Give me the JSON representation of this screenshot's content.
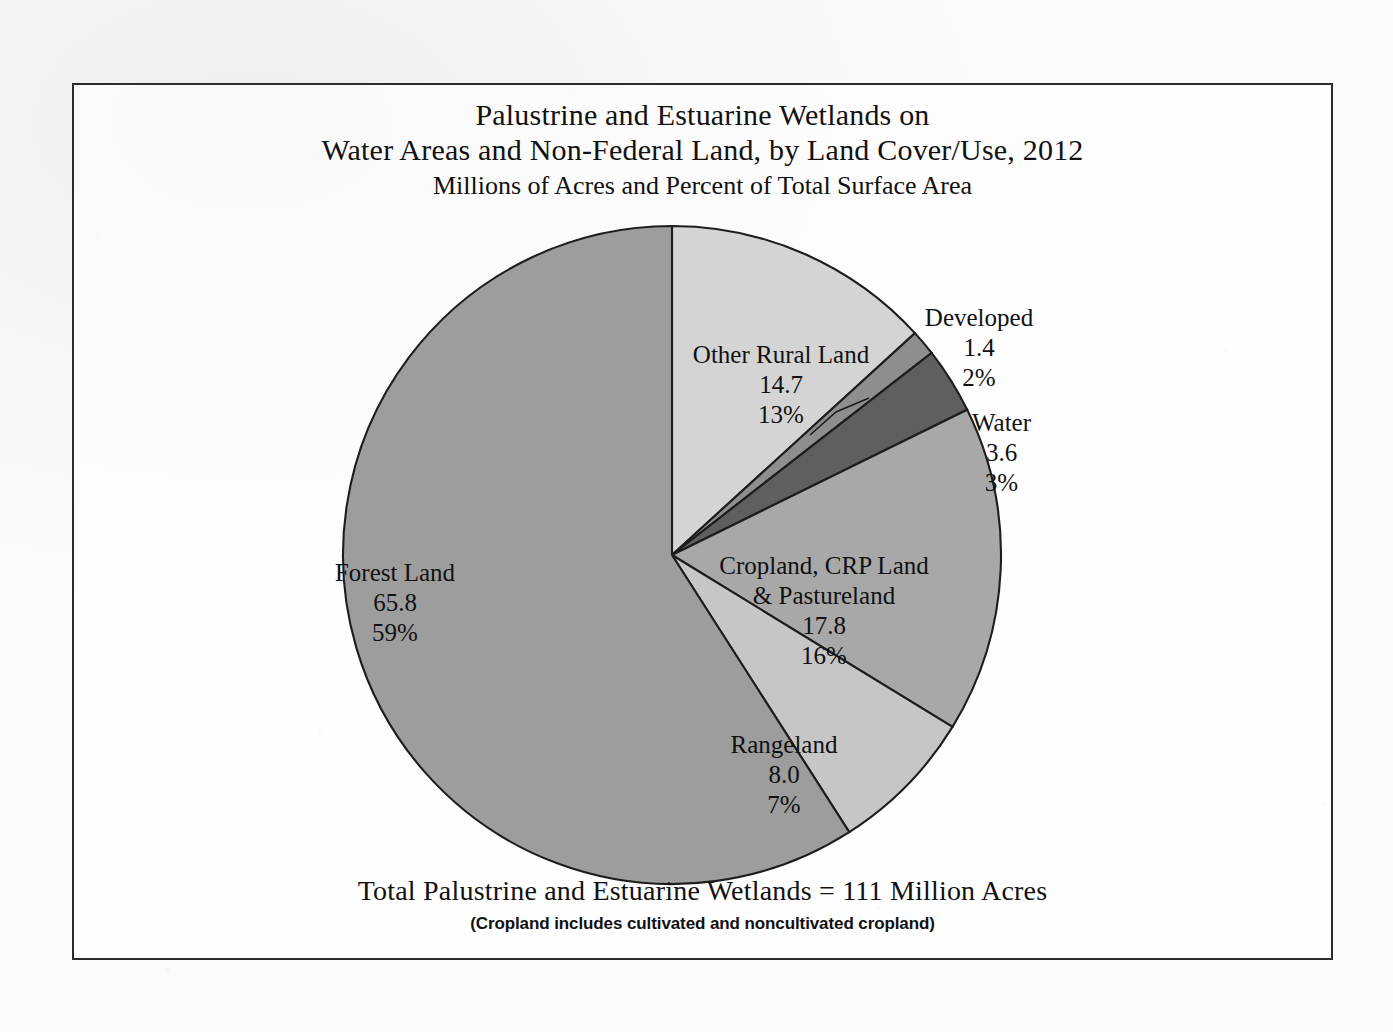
{
  "chart_data": {
    "type": "pie",
    "title": "Palustrine and Estuarine Wetlands on Water Areas and Non-Federal Land, by Land Cover/Use, 2012",
    "title_lines": [
      "Palustrine and Estuarine Wetlands on",
      "Water Areas and Non-Federal Land, by Land Cover/Use, 2012",
      "Millions of Acres and Percent of Total Surface Area"
    ],
    "subtitle": "Millions of Acres and Percent of Total Surface Area",
    "units": "Millions of Acres",
    "legend": "none",
    "total_label": "Total Palustrine and Estuarine Wetlands = 111 Million Acres",
    "total_value": 111,
    "footnote": "(Cropland includes cultivated and noncultivated cropland)",
    "categories": [
      "Other Rural Land",
      "Developed",
      "Water",
      "Cropland, CRP Land & Pastureland",
      "Rangeland",
      "Forest Land"
    ],
    "values": [
      14.7,
      1.4,
      3.6,
      17.8,
      8.0,
      65.8
    ],
    "percents": [
      13,
      2,
      3,
      16,
      7,
      59
    ],
    "slices": [
      {
        "name": "Other Rural Land",
        "name_lines": [
          "Other Rural Land"
        ],
        "value": "14.7",
        "percent": "13%",
        "color": "#d4d4d4",
        "start_deg": 0,
        "sweep_deg": 47.6,
        "label_placement": "inside"
      },
      {
        "name": "Developed",
        "name_lines": [
          "Developed"
        ],
        "value": "1.4",
        "percent": "2%",
        "color": "#8e8e8e",
        "start_deg": 47.6,
        "sweep_deg": 4.5,
        "label_placement": "callout"
      },
      {
        "name": "Water",
        "name_lines": [
          "Water"
        ],
        "value": "3.6",
        "percent": "3%",
        "color": "#5f5f5f",
        "start_deg": 52.1,
        "sweep_deg": 11.7,
        "label_placement": "outside"
      },
      {
        "name": "Cropland, CRP Land & Pastureland",
        "name_lines": [
          "Cropland, CRP Land",
          "& Pastureland"
        ],
        "value": "17.8",
        "percent": "16%",
        "color": "#a8a8a8",
        "start_deg": 63.8,
        "sweep_deg": 57.7,
        "label_placement": "inside"
      },
      {
        "name": "Rangeland",
        "name_lines": [
          "Rangeland"
        ],
        "value": "8.0",
        "percent": "7%",
        "color": "#c6c6c6",
        "start_deg": 121.5,
        "sweep_deg": 25.9,
        "label_placement": "inside"
      },
      {
        "name": "Forest Land",
        "name_lines": [
          "Forest Land"
        ],
        "value": "65.8",
        "percent": "59%",
        "color": "#9d9d9d",
        "start_deg": 147.4,
        "sweep_deg": 212.6,
        "label_placement": "inside"
      }
    ],
    "geometry": {
      "cx": 598,
      "cy": 470,
      "r": 329
    },
    "colors": {
      "outline": "#1d1d1d",
      "frame": "#2c2c2c",
      "text": "#111111",
      "background": "#f7f7f7"
    }
  },
  "labels": {
    "other_rural": {
      "name": "Other Rural Land",
      "value": "14.7",
      "percent": "13%"
    },
    "developed": {
      "name": "Developed",
      "value": "1.4",
      "percent": "2%"
    },
    "water": {
      "name": "Water",
      "value": "3.6",
      "percent": "3%"
    },
    "cropland": {
      "name_1": "Cropland, CRP Land",
      "name_2": "& Pastureland",
      "value": "17.8",
      "percent": "16%"
    },
    "rangeland": {
      "name": "Rangeland",
      "value": "8.0",
      "percent": "7%"
    },
    "forest": {
      "name": "Forest Land",
      "value": "65.8",
      "percent": "59%"
    }
  }
}
